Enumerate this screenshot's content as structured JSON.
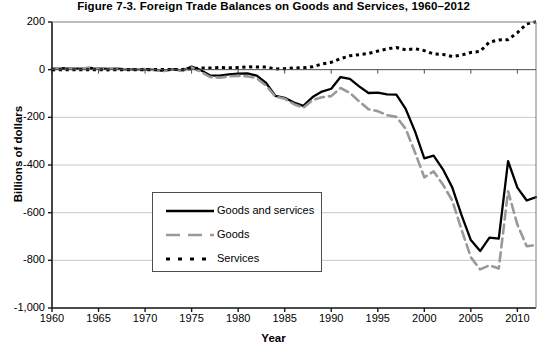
{
  "chart_data": {
    "type": "line",
    "title": "Figure 7-3. Foreign Trade Balances on Goods and Services, 1960–2012",
    "xlabel": "Year",
    "ylabel": "Billions of dollars",
    "xlim": [
      1960,
      2012
    ],
    "ylim": [
      -1000,
      200
    ],
    "ytick_labels": [
      "200",
      "0",
      "-200",
      "-400",
      "-600",
      "-800",
      "-1,000"
    ],
    "ytick_values": [
      200,
      0,
      -200,
      -400,
      -600,
      -800,
      -1000
    ],
    "xtick_labels": [
      "1960",
      "1965",
      "1970",
      "1975",
      "1980",
      "1985",
      "1990",
      "1995",
      "2000",
      "2005",
      "2010"
    ],
    "xtick_values": [
      1960,
      1965,
      1970,
      1975,
      1980,
      1985,
      1990,
      1995,
      2000,
      2005,
      2010
    ],
    "grid": "horizontal",
    "legend_position": "center-left",
    "x": [
      1960,
      1961,
      1962,
      1963,
      1964,
      1965,
      1966,
      1967,
      1968,
      1969,
      1970,
      1971,
      1972,
      1973,
      1974,
      1975,
      1976,
      1977,
      1978,
      1979,
      1980,
      1981,
      1982,
      1983,
      1984,
      1985,
      1986,
      1987,
      1988,
      1989,
      1990,
      1991,
      1992,
      1993,
      1994,
      1995,
      1996,
      1997,
      1998,
      1999,
      2000,
      2001,
      2002,
      2003,
      2004,
      2005,
      2006,
      2007,
      2008,
      2009,
      2010,
      2011,
      2012
    ],
    "series": [
      {
        "name": "Goods and services",
        "color": "#000000",
        "style": "solid",
        "values": [
          4,
          6,
          4,
          5,
          7,
          5,
          3,
          4,
          1,
          1,
          2,
          -1,
          -5,
          2,
          -4,
          13,
          -2,
          -24,
          -25,
          -20,
          -17,
          -16,
          -25,
          -56,
          -110,
          -118,
          -138,
          -152,
          -115,
          -92,
          -80,
          -31,
          -39,
          -70,
          -98,
          -96,
          -104,
          -105,
          -165,
          -259,
          -372,
          -361,
          -418,
          -494,
          -610,
          -715,
          -761,
          -705,
          -709,
          -384,
          -495,
          -549,
          -535
        ]
      },
      {
        "name": "Goods",
        "color": "#999999",
        "style": "dashed",
        "values": [
          5,
          6,
          4,
          5,
          7,
          5,
          4,
          4,
          1,
          1,
          3,
          -2,
          -6,
          1,
          -5,
          9,
          -9,
          -31,
          -34,
          -28,
          -26,
          -28,
          -36,
          -67,
          -113,
          -122,
          -145,
          -160,
          -127,
          -116,
          -111,
          -77,
          -97,
          -133,
          -166,
          -174,
          -191,
          -198,
          -248,
          -347,
          -452,
          -427,
          -482,
          -549,
          -671,
          -787,
          -838,
          -821,
          -834,
          -510,
          -650,
          -741,
          -736
        ]
      },
      {
        "name": "Services",
        "color": "#000000",
        "style": "dotted",
        "values": [
          -1,
          0,
          0,
          0,
          0,
          0,
          -1,
          0,
          0,
          0,
          -1,
          1,
          1,
          1,
          1,
          4,
          7,
          7,
          9,
          8,
          9,
          12,
          11,
          11,
          3,
          4,
          7,
          8,
          12,
          24,
          31,
          46,
          58,
          63,
          68,
          78,
          87,
          93,
          83,
          88,
          80,
          66,
          64,
          55,
          61,
          72,
          77,
          116,
          125,
          126,
          155,
          192,
          201
        ]
      }
    ]
  },
  "legend": {
    "items": [
      {
        "label": "Goods and services"
      },
      {
        "label": "Goods"
      },
      {
        "label": "Services"
      }
    ]
  }
}
